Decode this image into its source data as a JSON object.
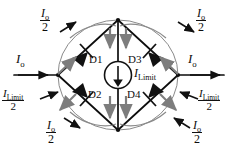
{
  "figure": {
    "type": "circuit-schematic",
    "colors": {
      "wire": "#0d0d0d",
      "loop_arrow": "#6e6e6e",
      "solid_arrow": "#111111",
      "background": "#ffffff"
    }
  },
  "diodes": [
    {
      "id": "D1",
      "label": "D1",
      "orientation": "up-right"
    },
    {
      "id": "D3",
      "label": "D3",
      "orientation": "up-left"
    },
    {
      "id": "D2",
      "label": "D2",
      "orientation": "down-left"
    },
    {
      "id": "D4",
      "label": "D4",
      "orientation": "down-right"
    }
  ],
  "source": {
    "name": "current-source",
    "label_italic": "I",
    "label_sub": "Limit",
    "direction": "down"
  },
  "labels": {
    "input_current": {
      "symbol": "I",
      "sub": "o",
      "text": "Io"
    },
    "output_current": {
      "symbol": "I",
      "sub": "o",
      "text": "Io"
    },
    "half_io": {
      "numerator_symbol": "I",
      "numerator_sub": "o",
      "denominator": "2"
    },
    "half_ilimit": {
      "numerator_symbol": "I",
      "numerator_sub": "Limit",
      "denominator": "2"
    }
  },
  "branch_labels": [
    {
      "name": "top-left-half-io",
      "kind": "half_io",
      "x": 42,
      "y": 12
    },
    {
      "name": "top-right-half-io",
      "kind": "half_io",
      "x": 163,
      "y": 12
    },
    {
      "name": "bottom-left-half-io",
      "kind": "half_io",
      "x": 48,
      "y": 116
    },
    {
      "name": "bottom-right-half-io",
      "kind": "half_io",
      "x": 162,
      "y": 116
    },
    {
      "name": "left-half-ilimit",
      "kind": "half_ilimit",
      "x": 2,
      "y": 86
    },
    {
      "name": "right-half-ilimit",
      "kind": "half_ilimit",
      "x": 187,
      "y": 86
    },
    {
      "name": "left-input-io",
      "kind": "io",
      "x": 14,
      "y": 58
    },
    {
      "name": "right-output-io",
      "kind": "io",
      "x": 186,
      "y": 58
    }
  ]
}
